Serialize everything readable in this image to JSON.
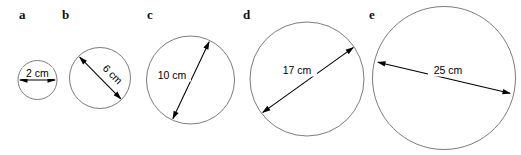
{
  "figure": {
    "background_color": "#ffffff",
    "circle_stroke_color": "#6d6d6d",
    "arrow_color": "#000000",
    "label_color": "#000000",
    "width": 521,
    "height": 155
  },
  "chart_data": {
    "type": "diagram",
    "title": "",
    "xlabel": "",
    "ylabel": "",
    "units": "cm",
    "categories": [
      "a",
      "b",
      "c",
      "d",
      "e"
    ],
    "values": [
      2,
      6,
      10,
      17,
      25
    ],
    "series": [
      {
        "name": "diameter",
        "values": [
          2,
          6,
          10,
          17,
          25
        ]
      }
    ],
    "annotations": [
      "2 cm",
      "6 cm",
      "10 cm",
      "17 cm",
      "25 cm"
    ],
    "legend": "none",
    "grid": false
  },
  "items": [
    {
      "letter": "a",
      "measurement": "2 cm",
      "diameter_value": 2,
      "letter_x": 19,
      "letter_y": 19,
      "cx": 37.5,
      "cy": 80,
      "r": 19.5,
      "arrow_x1": 19.0,
      "arrow_y1": 80.0,
      "arrow_x2": 56.0,
      "arrow_y2": 80.0,
      "label_x": 37.5,
      "label_y": 76.5,
      "label_rotate": 0,
      "label_w": 30,
      "label_h": 12
    },
    {
      "letter": "b",
      "measurement": "6 cm",
      "diameter_value": 6,
      "letter_x": 62,
      "letter_y": 19,
      "cx": 100,
      "cy": 78,
      "r": 30.5,
      "arrow_x1": 79.0,
      "arrow_y1": 56.5,
      "arrow_x2": 121.5,
      "arrow_y2": 99.5,
      "label_x": 110,
      "label_y": 77,
      "label_rotate": 45,
      "label_w": 32,
      "label_h": 13
    },
    {
      "letter": "c",
      "measurement": "10 cm",
      "diameter_value": 10,
      "letter_x": 147,
      "letter_y": 19,
      "cx": 190.5,
      "cy": 80,
      "r": 44.0,
      "arrow_x1": 172.5,
      "arrow_y1": 119.5,
      "arrow_x2": 209.5,
      "arrow_y2": 41.0,
      "label_x": 172,
      "label_y": 79,
      "label_rotate": 0,
      "label_w": 38,
      "label_h": 13
    },
    {
      "letter": "d",
      "measurement": "17 cm",
      "diameter_value": 17,
      "letter_x": 243,
      "letter_y": 19,
      "cx": 307,
      "cy": 79,
      "r": 57.0,
      "arrow_x1": 262.0,
      "arrow_y1": 113.0,
      "arrow_x2": 354.0,
      "arrow_y2": 47.0,
      "label_x": 297,
      "label_y": 74,
      "label_rotate": 0,
      "label_w": 40,
      "label_h": 13
    },
    {
      "letter": "e",
      "measurement": "25 cm",
      "diameter_value": 25,
      "letter_x": 369,
      "letter_y": 19,
      "cx": 444,
      "cy": 78,
      "r": 71.5,
      "arrow_x1": 377.0,
      "arrow_y1": 62.0,
      "arrow_x2": 511.0,
      "arrow_y2": 93.5,
      "label_x": 448,
      "label_y": 74,
      "label_rotate": 0,
      "label_w": 40,
      "label_h": 13
    }
  ]
}
